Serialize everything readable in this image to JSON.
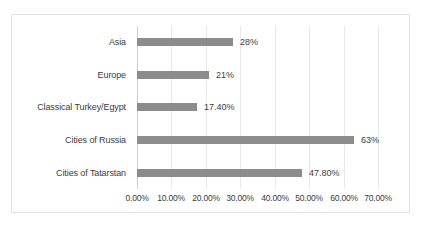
{
  "chart_data": {
    "type": "bar",
    "orientation": "horizontal",
    "title": "",
    "subtitle": "",
    "xlabel": "",
    "ylabel": "",
    "categories": [
      "Asia",
      "Europe",
      "Classical Turkey/Egypt",
      "Cities of Russia",
      "Cities of Tatarstan"
    ],
    "values": [
      28,
      21,
      17.4,
      63,
      47.8
    ],
    "data_labels": [
      "28%",
      "21%",
      "17.40%",
      "63%",
      "47.80%"
    ],
    "xlim": [
      0,
      70
    ],
    "x_ticks": [
      0,
      10,
      20,
      30,
      40,
      50,
      60,
      70
    ],
    "x_tick_labels": [
      "0.00%",
      "10.00%",
      "20.00%",
      "30.00%",
      "40.00%",
      "50.00%",
      "60.00%",
      "70.00%"
    ],
    "grid": true,
    "grid_axis": "x",
    "legend": false,
    "legend_position": "none",
    "series": [
      {
        "name": "",
        "values": [
          28,
          21,
          17.4,
          63,
          47.8
        ]
      }
    ]
  },
  "style": {
    "bar_color": "#8c8c8c",
    "gridline_color": "#e8e8e8",
    "axis_line_color": "#d0d0d0",
    "frame_border_color": "#e2e2e2",
    "text_color": "#3b3b3b",
    "background_color": "#ffffff"
  }
}
